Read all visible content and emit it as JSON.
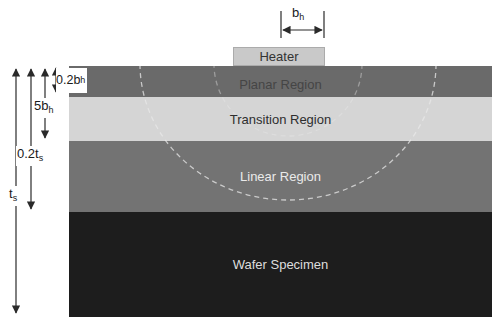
{
  "diagram": {
    "heater": {
      "label": "Heater",
      "fill": "#c9c9c9",
      "text_color": "#333333"
    },
    "regions": [
      {
        "id": "planar",
        "label": "Planar Region",
        "fill": "#6a6a6a",
        "text_color": "#454545"
      },
      {
        "id": "transition",
        "label": "Transition Region",
        "fill": "#d5d5d5",
        "text_color": "#2e2e2e"
      },
      {
        "id": "linear",
        "label": "Linear Region",
        "fill": "#737373",
        "text_color": "#eaeaea"
      },
      {
        "id": "wafer",
        "label": "Wafer Specimen",
        "fill": "#1d1d1d",
        "text_color": "#dddddd"
      }
    ],
    "dimensions": {
      "heater_half_width": {
        "base": "b",
        "sub": "h"
      },
      "planar_depth": {
        "base": "0.2b",
        "sub": "h"
      },
      "transition_depth": {
        "base": "5b",
        "sub": "h"
      },
      "linear_depth": {
        "base": "0.2t",
        "sub": "s"
      },
      "specimen_thickness": {
        "base": "t",
        "sub": "s"
      }
    },
    "isotherm_arcs": {
      "style": "dashed",
      "count": 2,
      "color": "#e8e8e8"
    },
    "colors": {
      "background": "#ffffff",
      "dimension_lines": "#2a2a2a"
    }
  }
}
